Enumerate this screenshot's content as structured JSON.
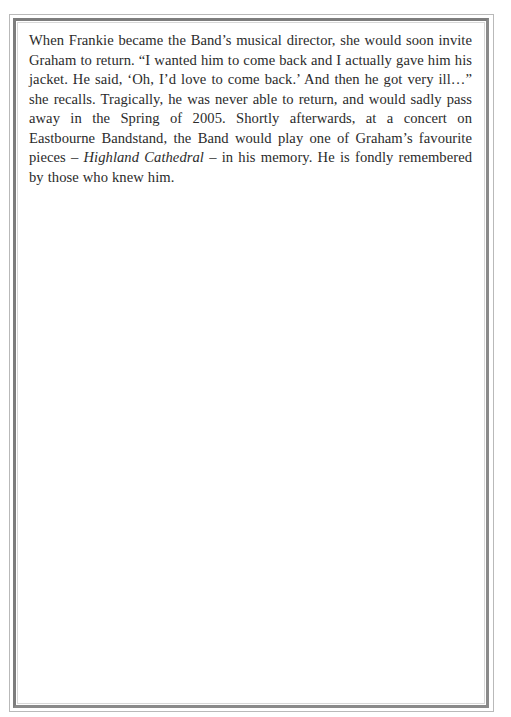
{
  "page": {
    "cut_off_top_line": "",
    "paragraph": {
      "part1": "When Frankie became the Band’s musical director, she would soon invite Graham to return. “I wanted him to come back and I actually gave him his jacket. He said, ‘Oh, I’d love to come back.’ And then he got very ill…” she recalls. Tragically, he was never able to return, and would sadly pass away in the Spring of 2005. Shortly afterwards, at a concert on Eastbourne Bandstand, the Band would play one of Graham’s favourite pieces – ",
      "italic_title": "Highland Cathedral",
      "part2": " – in his memory. He is fondly remembered by those who knew him."
    }
  },
  "colors": {
    "text": "#2b2b2b",
    "frame_outer": "#b9b9b9",
    "frame_inner": "#7d7d7d",
    "background": "#ffffff"
  }
}
